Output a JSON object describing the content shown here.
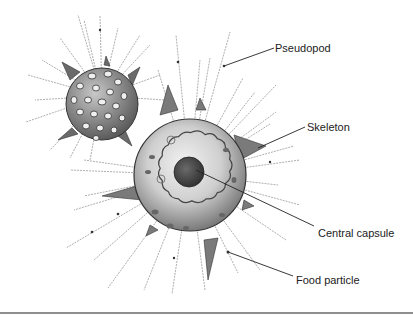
{
  "diagram": {
    "labels": [
      {
        "id": "pseudopod",
        "text": "Pseudopod",
        "x": 275,
        "y": 42,
        "leader": [
          [
            274,
            48
          ],
          [
            224,
            66
          ]
        ]
      },
      {
        "id": "skeleton",
        "text": "Skeleton",
        "x": 307,
        "y": 121,
        "leader": [
          [
            305,
            127
          ],
          [
            258,
            148
          ]
        ]
      },
      {
        "id": "central-capsule",
        "text": "Central capsule",
        "x": 318,
        "y": 227,
        "leader": [
          [
            314,
            226
          ],
          [
            188,
            170
          ]
        ]
      },
      {
        "id": "food-particle",
        "text": "Food particle",
        "x": 296,
        "y": 274,
        "leader": [
          [
            293,
            276
          ],
          [
            228,
            252
          ]
        ]
      }
    ],
    "colors": {
      "ink": "#222222",
      "shell_light": "#dedede",
      "shell_mid": "#b5b5b5",
      "shell_dark": "#6e6e6e",
      "capsule": "#4a4a4a",
      "rule": "#8f8f8f"
    }
  }
}
